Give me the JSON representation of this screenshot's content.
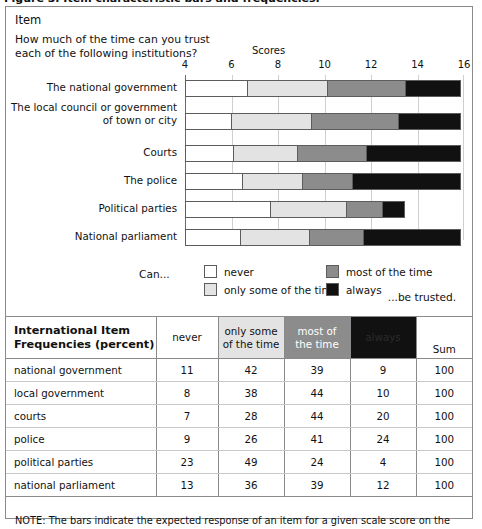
{
  "caption_sliver": "Figure 3. Item characteristic bars and frequencies.",
  "panel": {
    "item_header": "Item",
    "question": "How much of the time can you trust each of the following institutions?",
    "scores_label": "Scores"
  },
  "chart_data": {
    "type": "bar",
    "subtype": "stacked-horizontal-100-scale",
    "title": "Item",
    "xlabel": "Scores",
    "ylabel": "",
    "xlim": [
      4,
      16
    ],
    "xticks": [
      4,
      6,
      8,
      10,
      12,
      14,
      16
    ],
    "grid": true,
    "legend_position": "below",
    "categories": [
      "The national government",
      "The local council or government of town or city",
      "Courts",
      "The police",
      "Political parties",
      "National parliament"
    ],
    "series": [
      {
        "name": "never",
        "color": "#ffffff",
        "boundaries_end": [
          6.7,
          6.0,
          6.1,
          6.5,
          7.7,
          6.4
        ]
      },
      {
        "name": "only some of the time",
        "color": "#e3e3e3",
        "boundaries_end": [
          10.2,
          9.5,
          8.9,
          9.1,
          11.0,
          9.4
        ]
      },
      {
        "name": "most of the time",
        "color": "#8c8c8c",
        "boundaries_end": [
          13.6,
          13.3,
          11.9,
          11.3,
          12.6,
          11.8
        ]
      },
      {
        "name": "always",
        "color": "#111111",
        "boundaries_end": [
          16.0,
          16.0,
          16.0,
          16.0,
          13.6,
          16.0
        ]
      }
    ]
  },
  "legend": {
    "prefix": "Can...",
    "suffix": "...be trusted.",
    "items": [
      {
        "label": "never",
        "color": "#ffffff"
      },
      {
        "label": "only some of the time",
        "color": "#e3e3e3"
      },
      {
        "label": "most of the time",
        "color": "#8c8c8c"
      },
      {
        "label": "always",
        "color": "#111111"
      }
    ]
  },
  "table": {
    "corner_line1": "International Item",
    "corner_line2": "Frequencies (percent)",
    "headers": [
      "never",
      "only some of the time",
      "most of the time",
      "always",
      "Sum"
    ],
    "header_parts": {
      "never": "never",
      "some_l1": "only some",
      "some_l2": "of the time",
      "most_l1": "most of",
      "most_l2": "the time",
      "always": "always",
      "sum": "Sum"
    },
    "rows": [
      {
        "name": "national government",
        "never": "11",
        "some": "42",
        "most": "39",
        "always": "9",
        "sum": "100"
      },
      {
        "name": "local government",
        "never": "8",
        "some": "38",
        "most": "44",
        "always": "10",
        "sum": "100"
      },
      {
        "name": "courts",
        "never": "7",
        "some": "28",
        "most": "44",
        "always": "20",
        "sum": "100"
      },
      {
        "name": "police",
        "never": "9",
        "some": "26",
        "most": "41",
        "always": "24",
        "sum": "100"
      },
      {
        "name": "political parties",
        "never": "23",
        "some": "49",
        "most": "24",
        "always": "4",
        "sum": "100"
      },
      {
        "name": "national parliament",
        "never": "13",
        "some": "36",
        "most": "39",
        "always": "12",
        "sum": "100"
      }
    ]
  },
  "note": "NOTE: The bars indicate the expected response of an item for a given scale score on the"
}
